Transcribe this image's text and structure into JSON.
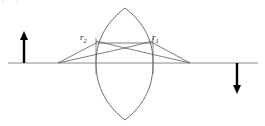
{
  "figure": {
    "top_artifact_text": "(\" \" ) \"",
    "colors": {
      "stroke": "#4a4a4a",
      "axis": "#7a7a7a",
      "arrow": "#000000",
      "label": "#1a1a1a",
      "background": "#ffffff"
    },
    "labels": {
      "ray_left": "r",
      "ray_left_sub": "2",
      "ray_right": "r",
      "ray_right_sub": "1"
    },
    "geometry": {
      "axis_y": 63,
      "axis_x1": 8,
      "axis_x2": 258,
      "lens_center_x": 125,
      "lens_left_x": 96,
      "lens_right_x": 153,
      "lens_top_y": 8,
      "lens_bottom_y": 120,
      "object_arrow_x": 24,
      "object_arrow_top_y": 33,
      "image_arrow_x": 237,
      "image_arrow_bottom_y": 92,
      "ray_cross_x": 125,
      "ray_cross_y": 48,
      "ray_left_origin_x": 58,
      "ray_right_end_x": 190
    }
  }
}
